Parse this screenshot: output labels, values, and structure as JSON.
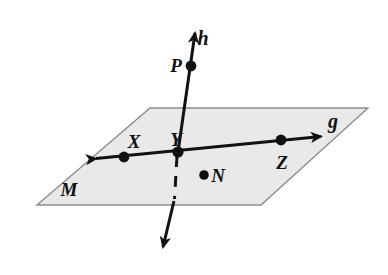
{
  "figure": {
    "type": "geometry-diagram",
    "background_color": "#ffffff",
    "plane": {
      "name": "M",
      "label": "M",
      "label_x": 62,
      "label_y": 195,
      "fill_color": "#e9e9e9",
      "stroke_color": "#8d8d8d",
      "stroke_width": 1.4,
      "corners": [
        {
          "x": 150,
          "y": 108
        },
        {
          "x": 368,
          "y": 108
        },
        {
          "x": 261,
          "y": 205
        },
        {
          "x": 37,
          "y": 205
        }
      ]
    },
    "lines": [
      {
        "id": "line-g",
        "label": "g",
        "label_x": 331,
        "label_y": 128,
        "stroke_color": "#111111",
        "stroke_width": 3.0,
        "style": "solid",
        "arrows": "both",
        "start": {
          "x": 92,
          "y": 159
        },
        "end": {
          "x": 325,
          "y": 136
        },
        "lies_in_plane": "M"
      },
      {
        "id": "line-h-upper",
        "label": "h",
        "label_x": 203,
        "label_y": 45,
        "stroke_color": "#111111",
        "stroke_width": 3.0,
        "style": "solid",
        "arrows": "start",
        "start": {
          "x": 196,
          "y": 29
        },
        "end": {
          "x": 178,
          "y": 152
        }
      },
      {
        "id": "line-h-hidden",
        "label": "",
        "stroke_color": "#111111",
        "stroke_width": 3.0,
        "style": "dashed",
        "dash_pattern": "11 9",
        "arrows": "none",
        "start": {
          "x": 177,
          "y": 154
        },
        "end": {
          "x": 174,
          "y": 201
        }
      },
      {
        "id": "line-h-lower",
        "label": "",
        "stroke_color": "#111111",
        "stroke_width": 3.0,
        "style": "solid",
        "arrows": "end",
        "start": {
          "x": 174,
          "y": 201
        },
        "end": {
          "x": 162,
          "y": 251
        }
      }
    ],
    "points": [
      {
        "id": "point-p",
        "label": "P",
        "x": 191,
        "y": 66,
        "radius": 5.4,
        "label_x": 176,
        "label_y": 72,
        "color": "#111111",
        "on": "line-h",
        "in_plane": false
      },
      {
        "id": "point-x",
        "label": "X",
        "x": 124,
        "y": 157,
        "radius": 5.4,
        "label_x": 133,
        "label_y": 147,
        "color": "#111111",
        "on": "line-g",
        "in_plane": true
      },
      {
        "id": "point-y",
        "label": "Y",
        "x": 178,
        "y": 152,
        "radius": 5.6,
        "label_x": 173,
        "label_y": 145,
        "color": "#111111",
        "on": "line-g and line-h",
        "in_plane": true
      },
      {
        "id": "point-z",
        "label": "Z",
        "x": 281,
        "y": 140,
        "radius": 5.4,
        "label_x": 275,
        "label_y": 168,
        "color": "#111111",
        "on": "line-g",
        "in_plane": true
      },
      {
        "id": "point-n",
        "label": "N",
        "x": 204,
        "y": 175,
        "radius": 4.8,
        "label_x": 211,
        "label_y": 182,
        "color": "#111111",
        "on": "",
        "in_plane": true
      }
    ]
  }
}
